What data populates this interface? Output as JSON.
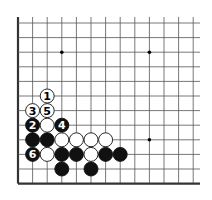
{
  "diagram": {
    "board": {
      "visible_columns": 13,
      "visible_rows": 12,
      "edges": [
        "left",
        "bottom"
      ],
      "star_points": [
        {
          "col": 3,
          "row": 2
        },
        {
          "col": 9,
          "row": 2
        },
        {
          "col": 9,
          "row": 8
        }
      ]
    },
    "stones": [
      {
        "color": "white",
        "col": 2,
        "row": 5,
        "label": "1"
      },
      {
        "color": "black",
        "col": 1,
        "row": 7,
        "label": "2"
      },
      {
        "color": "white",
        "col": 1,
        "row": 6,
        "label": "3"
      },
      {
        "color": "black",
        "col": 3,
        "row": 7,
        "label": "4"
      },
      {
        "color": "white",
        "col": 2,
        "row": 6,
        "label": "5"
      },
      {
        "color": "black",
        "col": 1,
        "row": 9,
        "label": "6"
      },
      {
        "color": "white",
        "col": 2,
        "row": 7,
        "label": ""
      },
      {
        "color": "black",
        "col": 1,
        "row": 8,
        "label": ""
      },
      {
        "color": "black",
        "col": 2,
        "row": 8,
        "label": ""
      },
      {
        "color": "white",
        "col": 3,
        "row": 8,
        "label": ""
      },
      {
        "color": "white",
        "col": 4,
        "row": 8,
        "label": ""
      },
      {
        "color": "white",
        "col": 5,
        "row": 8,
        "label": ""
      },
      {
        "color": "white",
        "col": 6,
        "row": 8,
        "label": ""
      },
      {
        "color": "white",
        "col": 2,
        "row": 9,
        "label": ""
      },
      {
        "color": "black",
        "col": 3,
        "row": 9,
        "label": ""
      },
      {
        "color": "black",
        "col": 4,
        "row": 9,
        "label": ""
      },
      {
        "color": "white",
        "col": 5,
        "row": 9,
        "label": ""
      },
      {
        "color": "black",
        "col": 6,
        "row": 9,
        "label": ""
      },
      {
        "color": "black",
        "col": 7,
        "row": 9,
        "label": ""
      },
      {
        "color": "black",
        "col": 3,
        "row": 10,
        "label": ""
      },
      {
        "color": "black",
        "col": 5,
        "row": 10,
        "label": ""
      }
    ],
    "colors": {
      "line": "#555555",
      "edge": "#333333",
      "black_stone": "#111111",
      "white_stone": "#ffffff",
      "background": "#ffffff"
    }
  }
}
